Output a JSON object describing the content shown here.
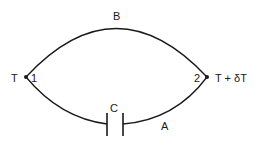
{
  "diagram": {
    "type": "thermocouple-circuit",
    "labels": {
      "top_wire": "B",
      "bottom_wire": "A",
      "capacitor": "C",
      "junction_left_number": "1",
      "junction_right_number": "2",
      "temp_left": "T",
      "temp_right": "T + δT"
    },
    "nodes": [
      {
        "id": "1",
        "temperature": "T"
      },
      {
        "id": "2",
        "temperature": "T + δT"
      }
    ],
    "branches": [
      {
        "from": "1",
        "to": "2",
        "label": "B",
        "path": "upper-arc"
      },
      {
        "from": "1",
        "to": "2",
        "label": "A",
        "path": "lower-arc",
        "contains": "capacitor C"
      }
    ],
    "colors": {
      "line": "#1a1a1a",
      "background": "#ffffff"
    }
  }
}
